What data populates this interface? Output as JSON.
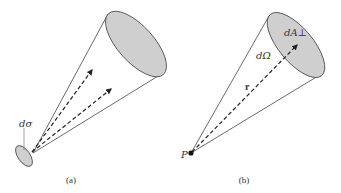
{
  "panels": [
    {
      "id": "a",
      "caption": "(a)",
      "labels": {
        "area_element": "dσ"
      },
      "description": "Cone emanating from a small area element dσ with two dashed arrows inside"
    },
    {
      "id": "b",
      "caption": "(b)",
      "labels": {
        "point": "P",
        "solid_angle": "dΩ",
        "position_vector": "r",
        "perpendicular_area": "dA⊥"
      },
      "description": "Cone from point P subtending solid angle dΩ onto perpendicular area dA⊥, with dashed vector r"
    }
  ],
  "colors": {
    "fill": "#cfcfcf",
    "stroke": "#444444",
    "background": "#ffffff"
  }
}
